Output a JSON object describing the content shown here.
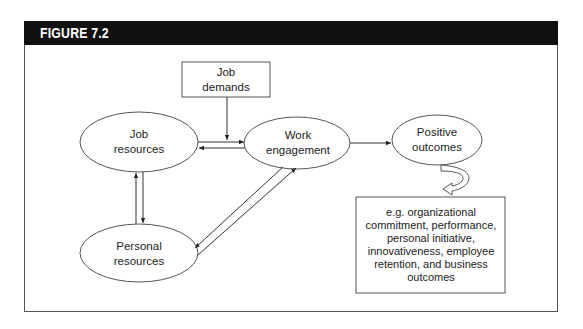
{
  "figure": {
    "title": "FIGURE 7.2",
    "header_color": "#111111"
  },
  "nodes": {
    "job_demands": {
      "lines": [
        "Job",
        "demands"
      ],
      "shape": "rectangle"
    },
    "job_resources": {
      "lines": [
        "Job",
        "resources"
      ],
      "shape": "ellipse"
    },
    "work_engagement": {
      "lines": [
        "Work",
        "engagement"
      ],
      "shape": "ellipse"
    },
    "positive_outcomes": {
      "lines": [
        "Positive",
        "outcomes"
      ],
      "shape": "ellipse"
    },
    "personal_resources": {
      "lines": [
        "Personal",
        "resources"
      ],
      "shape": "ellipse"
    },
    "outcomes_examples": {
      "shape": "rectangle",
      "lines": [
        "e.g. organizational",
        "commitment, performance,",
        "personal initiative,",
        "innovativeness, employee",
        "retention, and business",
        "outcomes"
      ]
    }
  },
  "edges": [
    {
      "from": "job_demands",
      "to": "job_resources-work_engagement link",
      "type": "arrow"
    },
    {
      "from": "job_resources",
      "to": "work_engagement",
      "type": "arrow"
    },
    {
      "from": "work_engagement",
      "to": "job_resources",
      "type": "arrow"
    },
    {
      "from": "job_resources",
      "to": "personal_resources",
      "type": "arrow"
    },
    {
      "from": "personal_resources",
      "to": "job_resources",
      "type": "arrow"
    },
    {
      "from": "work_engagement",
      "to": "personal_resources",
      "type": "arrow"
    },
    {
      "from": "personal_resources",
      "to": "work_engagement",
      "type": "arrow"
    },
    {
      "from": "work_engagement",
      "to": "positive_outcomes",
      "type": "arrow"
    },
    {
      "from": "positive_outcomes",
      "to": "outcomes_examples",
      "type": "curved-block-arrow"
    }
  ]
}
